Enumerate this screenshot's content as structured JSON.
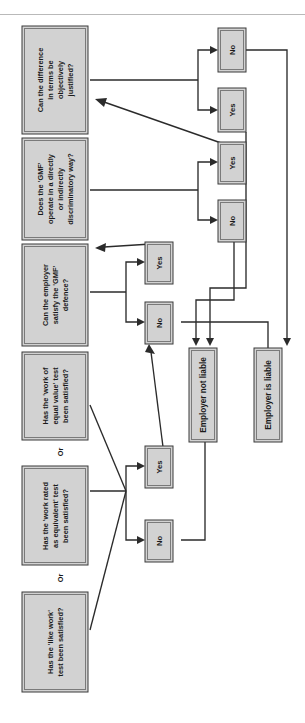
{
  "diagram": {
    "orientation": "rotated-90-ccw",
    "colors": {
      "node_fill": "#d2d2d2",
      "node_stroke": "#3a3a3a",
      "connector": "#2b2b2b",
      "background": "#ffffff",
      "rule": "#b9b9b9"
    },
    "questions": [
      {
        "id": "q-like-work",
        "lines": [
          "Has the 'like work'",
          "test been satisfied?"
        ],
        "text": "Has the 'like work' test been satisfied?"
      },
      {
        "id": "q-work-rated-equivalent",
        "lines": [
          "Has the 'work rated",
          "as equivalent' test",
          "been satisfied?"
        ],
        "text": "Has the 'work rated as equivalent' test been satisfied?"
      },
      {
        "id": "q-work-equal-value",
        "lines": [
          "Has the 'work of",
          "equal value' test",
          "been satisfied?"
        ],
        "text": "Has the 'work of equal value' test been satisfied?"
      },
      {
        "id": "q-gmf-defence",
        "lines": [
          "Can the employer",
          "satisfy the 'GMF'",
          "defence?"
        ],
        "text": "Can the employer satisfy the 'GMF' defence?"
      },
      {
        "id": "q-gmf-discriminatory",
        "lines": [
          "Does the 'GMF'",
          "operate in a directly",
          "or indirectly",
          "discriminatory way?"
        ],
        "text": "Does the 'GMF' operate in a directly or indirectly discriminatory way?"
      },
      {
        "id": "q-objectively-justified",
        "lines": [
          "Can the difference",
          "in terms be",
          "objectively",
          "justified?"
        ],
        "text": "Can the difference in terms be objectively justified?"
      }
    ],
    "connectors_or": [
      {
        "id": "or-1",
        "label": "Or"
      },
      {
        "id": "or-2",
        "label": "Or"
      }
    ],
    "decisions": [
      {
        "id": "d1-yes",
        "label": "Yes",
        "from": "q-work-equal-value"
      },
      {
        "id": "d1-no",
        "label": "No",
        "from": "q-work-equal-value"
      },
      {
        "id": "d2-yes",
        "label": "Yes",
        "from": "q-gmf-defence"
      },
      {
        "id": "d2-no",
        "label": "No",
        "from": "q-gmf-defence"
      },
      {
        "id": "d3-yes",
        "label": "Yes",
        "from": "q-gmf-discriminatory"
      },
      {
        "id": "d3-no",
        "label": "No",
        "from": "q-gmf-discriminatory"
      },
      {
        "id": "d4-yes",
        "label": "Yes",
        "from": "q-objectively-justified"
      },
      {
        "id": "d4-no",
        "label": "No",
        "from": "q-objectively-justified"
      }
    ],
    "outcomes": [
      {
        "id": "outcome-not-liable",
        "label": "Employer not liable"
      },
      {
        "id": "outcome-liable",
        "label": "Employer is liable"
      }
    ]
  }
}
